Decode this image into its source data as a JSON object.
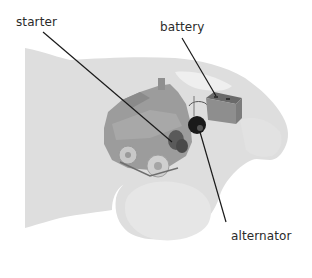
{
  "diagram": {
    "labels": [
      {
        "id": "starter",
        "text": "starter"
      },
      {
        "id": "battery",
        "text": "battery"
      },
      {
        "id": "alternator",
        "text": "alternator"
      }
    ],
    "colors": {
      "car_body": "#dedede",
      "car_body_light": "#e8e8e8",
      "engine": "#9a9a9a",
      "engine_dark": "#7e7e7e",
      "battery": "#8c8c8c",
      "alternator": "#1a1a1a",
      "leader_line": "#1a1a1a",
      "text": "#2b2b2b"
    }
  }
}
